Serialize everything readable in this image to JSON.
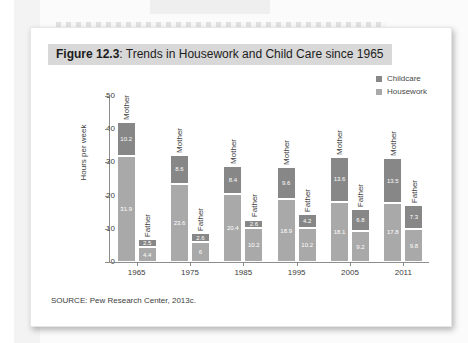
{
  "figure": {
    "number_label": "Figure 12.3",
    "title_rest": ": Trends in Housework and Child Care since 1965",
    "source": "SOURCE: Pew Research Center, 2013c."
  },
  "legend": {
    "items": [
      {
        "label": "Childcare",
        "color": "#878787"
      },
      {
        "label": "Housework",
        "color": "#a9a9a9"
      }
    ]
  },
  "chart_data": {
    "type": "bar",
    "title": "Figure 12.3: Trends in Housework and Child Care since 1965",
    "xlabel": "",
    "ylabel": "Hours per week",
    "ylim": [
      0,
      50
    ],
    "yticks": [
      0,
      10,
      20,
      30,
      40,
      50
    ],
    "grid": false,
    "legend_position": "top-right",
    "stacked": true,
    "categories": [
      "1965",
      "1975",
      "1985",
      "1995",
      "2005",
      "2011"
    ],
    "subgroups": [
      "Mother",
      "Father"
    ],
    "series": [
      {
        "name": "Childcare",
        "color": "#878787",
        "Mother": [
          10.2,
          8.6,
          8.4,
          9.6,
          13.6,
          13.5
        ],
        "Father": [
          2.5,
          2.6,
          2.6,
          4.2,
          6.8,
          7.3
        ]
      },
      {
        "name": "Housework",
        "color": "#a9a9a9",
        "Mother": [
          31.9,
          23.6,
          20.4,
          18.9,
          18.1,
          17.8
        ],
        "Father": [
          4.4,
          6,
          10.2,
          10.2,
          9.2,
          9.8
        ]
      }
    ],
    "bars": [
      {
        "year": "1965",
        "mother": {
          "label": "Mother",
          "childcare": "10.2",
          "housework": "31.9"
        },
        "father": {
          "label": "Father",
          "childcare": "2.5",
          "housework": "4.4"
        }
      },
      {
        "year": "1975",
        "mother": {
          "label": "Mother",
          "childcare": "8.6",
          "housework": "23.6"
        },
        "father": {
          "label": "Father",
          "childcare": "2.6",
          "housework": "6"
        }
      },
      {
        "year": "1985",
        "mother": {
          "label": "Mother",
          "childcare": "8.4",
          "housework": "20.4"
        },
        "father": {
          "label": "Father",
          "childcare": "2.6",
          "housework": "10.2"
        }
      },
      {
        "year": "1995",
        "mother": {
          "label": "Mother",
          "childcare": "9.6",
          "housework": "18.9"
        },
        "father": {
          "label": "Father",
          "childcare": "4.2",
          "housework": "10.2"
        }
      },
      {
        "year": "2005",
        "mother": {
          "label": "Mother",
          "childcare": "13.6",
          "housework": "18.1"
        },
        "father": {
          "label": "Father",
          "childcare": "6.8",
          "housework": "9.2"
        }
      },
      {
        "year": "2011",
        "mother": {
          "label": "Mother",
          "childcare": "13.5",
          "housework": "17.8"
        },
        "father": {
          "label": "Father",
          "childcare": "7.3",
          "housework": "9.8"
        }
      }
    ]
  }
}
